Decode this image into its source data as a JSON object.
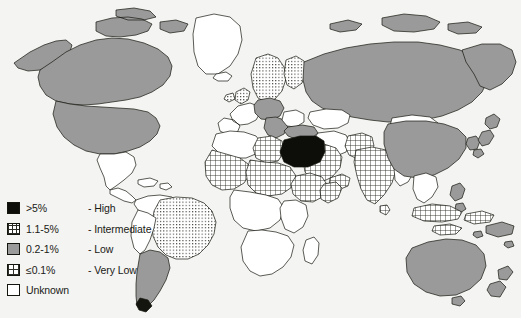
{
  "figure": {
    "type": "choropleth-world-map",
    "background_color": "#f4f4f2",
    "outline_color": "#15150f"
  },
  "legend": {
    "name": "prevalence-legend",
    "rows": [
      {
        "range": ">5%",
        "dash": "-",
        "description": "High",
        "pattern": "solid-black",
        "color": "#0d0d0a",
        "swatch_name": "swatch-high"
      },
      {
        "range": "1.1-5%",
        "dash": "-",
        "description": "Intermediate",
        "pattern": "cross-hatch",
        "color": "#ffffff",
        "swatch_name": "swatch-intermediate"
      },
      {
        "range": "0.2-1%",
        "dash": "-",
        "description": "Low",
        "pattern": "solid-gray",
        "color": "#9a9a9a",
        "swatch_name": "swatch-low"
      },
      {
        "range": "≤0.1%",
        "dash": "-",
        "description": "Very Low",
        "pattern": "fine-dot-grid",
        "color": "#ffffff",
        "swatch_name": "swatch-very-low"
      },
      {
        "range": "Unknown",
        "dash": "",
        "description": "",
        "pattern": "blank-white",
        "color": "#ffffff",
        "swatch_name": "swatch-unknown"
      }
    ]
  },
  "map_data": {
    "type": "choropleth",
    "categories": [
      "High",
      "Intermediate",
      "Low",
      "Very Low",
      "Unknown"
    ],
    "regions": [
      {
        "name": "Egypt",
        "category": "High"
      },
      {
        "name": "Canada",
        "category": "Low"
      },
      {
        "name": "United States",
        "category": "Low"
      },
      {
        "name": "Mexico",
        "category": "Unknown"
      },
      {
        "name": "Greenland",
        "category": "Unknown"
      },
      {
        "name": "Brazil",
        "category": "Very Low"
      },
      {
        "name": "Argentina",
        "category": "Low"
      },
      {
        "name": "Chile",
        "category": "Low"
      },
      {
        "name": "Peru",
        "category": "Unknown"
      },
      {
        "name": "Colombia",
        "category": "Unknown"
      },
      {
        "name": "Venezuela",
        "category": "Unknown"
      },
      {
        "name": "Russia",
        "category": "Low"
      },
      {
        "name": "China",
        "category": "Low"
      },
      {
        "name": "Mongolia",
        "category": "Unknown"
      },
      {
        "name": "India",
        "category": "Intermediate"
      },
      {
        "name": "Saudi Arabia",
        "category": "Intermediate"
      },
      {
        "name": "Yemen",
        "category": "Intermediate"
      },
      {
        "name": "Turkey",
        "category": "Low"
      },
      {
        "name": "Germany",
        "category": "Low"
      },
      {
        "name": "France",
        "category": "Unknown"
      },
      {
        "name": "Sweden",
        "category": "Very Low"
      },
      {
        "name": "Norway",
        "category": "Very Low"
      },
      {
        "name": "Finland",
        "category": "Very Low"
      },
      {
        "name": "United Kingdom",
        "category": "Very Low"
      },
      {
        "name": "Libya",
        "category": "Intermediate"
      },
      {
        "name": "Mali",
        "category": "Intermediate"
      },
      {
        "name": "Niger",
        "category": "Intermediate"
      },
      {
        "name": "Nigeria",
        "category": "Intermediate"
      },
      {
        "name": "Ethiopia",
        "category": "Intermediate"
      },
      {
        "name": "Somalia",
        "category": "Intermediate"
      },
      {
        "name": "Australia",
        "category": "Low"
      },
      {
        "name": "New Zealand",
        "category": "Low"
      },
      {
        "name": "Japan",
        "category": "Low"
      },
      {
        "name": "Indonesia",
        "category": "Intermediate"
      },
      {
        "name": "Philippines",
        "category": "Low"
      },
      {
        "name": "Thailand",
        "category": "Unknown"
      },
      {
        "name": "Vietnam",
        "category": "Unknown"
      },
      {
        "name": "Pakistan",
        "category": "Intermediate"
      }
    ]
  }
}
